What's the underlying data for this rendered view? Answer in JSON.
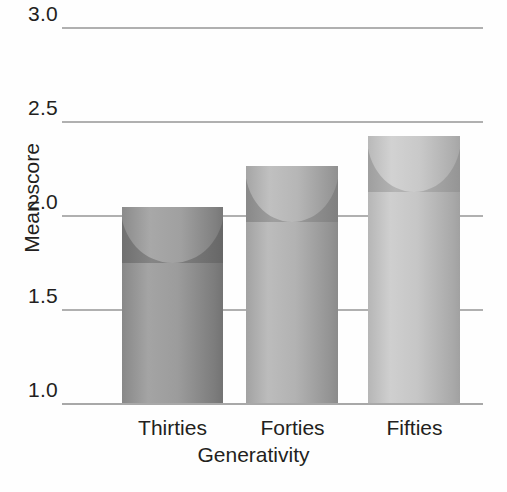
{
  "chart_data": {
    "type": "bar",
    "title": "",
    "subtitle": "",
    "xlabel": "Generativity",
    "ylabel": "Mean score",
    "categories": [
      "Thirties",
      "Forties",
      "Fifties"
    ],
    "values": [
      2.04,
      2.26,
      2.42
    ],
    "ylim": [
      1.0,
      3.0
    ],
    "yticks": [
      "1.0",
      "1.5",
      "2.0",
      "2.5",
      "3.0"
    ],
    "ytick_values": [
      1.0,
      1.5,
      2.0,
      2.5,
      3.0
    ],
    "grid": true,
    "legend": "none",
    "series": [
      {
        "name": "Mean score",
        "values": [
          2.04,
          2.26,
          2.42
        ]
      }
    ],
    "bar_style": "3d-cylinder",
    "colors": {
      "bar_thirties": "#8f8f8f",
      "bar_forties": "#a5a5a5",
      "bar_fifties": "#bcbcbc",
      "gridline": "#b0b0b0",
      "axis_text": "#231f20",
      "background": "#fefefe"
    }
  },
  "axis": {
    "y": {
      "label": "Mean score",
      "ticks": [
        {
          "text": "3.0"
        },
        {
          "text": "2.5"
        },
        {
          "text": "2.0"
        },
        {
          "text": "1.5"
        },
        {
          "text": "1.0"
        }
      ]
    },
    "x": {
      "label": "Generativity",
      "ticks": [
        {
          "text": "Thirties"
        },
        {
          "text": "Forties"
        },
        {
          "text": "Fifties"
        }
      ]
    }
  }
}
